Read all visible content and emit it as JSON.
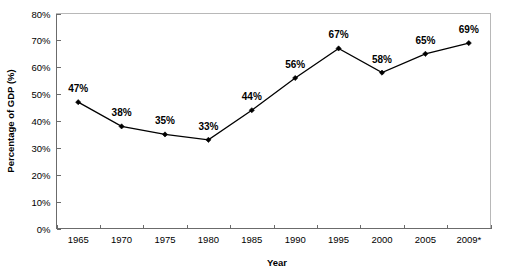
{
  "chart_data": {
    "type": "line",
    "title": "",
    "xlabel": "Year",
    "ylabel": "Percentage of GDP (%)",
    "categories": [
      "1965",
      "1970",
      "1975",
      "1980",
      "1985",
      "1990",
      "1995",
      "2000",
      "2005",
      "2009*"
    ],
    "values": [
      47,
      38,
      35,
      33,
      44,
      56,
      67,
      58,
      65,
      69
    ],
    "point_labels": [
      "47%",
      "38%",
      "35%",
      "33%",
      "44%",
      "56%",
      "67%",
      "58%",
      "65%",
      "69%"
    ],
    "ylim": [
      0,
      80
    ],
    "ytick_step": 10,
    "ytick_labels": [
      "80%",
      "70%",
      "60%",
      "50%",
      "40%",
      "30%",
      "20%",
      "10%",
      "0%"
    ],
    "ytick_values": [
      80,
      70,
      60,
      50,
      40,
      30,
      20,
      10,
      0
    ],
    "grid": false,
    "legend": "none",
    "marker": "diamond",
    "line_color": "#000000",
    "marker_color": "#000000",
    "plot_border_color": "#b8b8b8",
    "axis_color": "#6b6b6b",
    "background_color": "#ffffff"
  }
}
